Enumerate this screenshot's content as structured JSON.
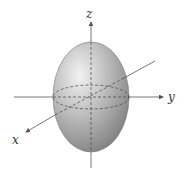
{
  "diagram": {
    "type": "3d-ellipsoid",
    "axes": {
      "x": {
        "label": "x"
      },
      "y": {
        "label": "y"
      },
      "z": {
        "label": "z"
      }
    },
    "colors": {
      "axis": "#555555",
      "body_light": "#e8e8e8",
      "body_dark": "#8a8a8a",
      "dashed": "#444444"
    }
  }
}
